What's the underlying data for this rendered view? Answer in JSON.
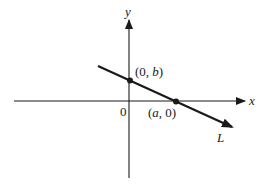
{
  "diagram": {
    "axes": {
      "x_label": "x",
      "y_label": "y",
      "origin_label": "0"
    },
    "line": {
      "label": "L",
      "description": "straight line with negative slope crossing both axes"
    },
    "points": [
      {
        "name": "y-intercept",
        "label_open": "(0, ",
        "label_var": "b",
        "label_close": ")"
      },
      {
        "name": "x-intercept",
        "label_open": "(",
        "label_var": "a",
        "label_close": ", 0)"
      }
    ],
    "colors": {
      "ink": "#1a1a1a",
      "background": "#ffffff"
    }
  }
}
